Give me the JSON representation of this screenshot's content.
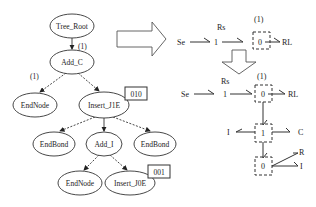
{
  "tree": {
    "nodes": [
      {
        "id": "tree_root",
        "label": "Tree_Root",
        "cx": 72,
        "cy": 26,
        "rx": 22,
        "ry": 12
      },
      {
        "id": "add_c",
        "label": "Add_C",
        "cx": 72,
        "cy": 62,
        "rx": 22,
        "ry": 12
      },
      {
        "id": "endnode_1",
        "label": "EndNode",
        "cx": 35,
        "cy": 105,
        "rx": 22,
        "ry": 12
      },
      {
        "id": "insert_j1e",
        "label": "Insert_J1E",
        "cx": 104,
        "cy": 105,
        "rx": 25,
        "ry": 13
      },
      {
        "id": "endbond_1",
        "label": "EndBond",
        "cx": 54,
        "cy": 144,
        "rx": 21,
        "ry": 12
      },
      {
        "id": "add_i",
        "label": "Add_I",
        "cx": 104,
        "cy": 144,
        "rx": 18,
        "ry": 12
      },
      {
        "id": "endbond_2",
        "label": "EndBond",
        "cx": 155,
        "cy": 144,
        "rx": 21,
        "ry": 12
      },
      {
        "id": "endnode_2",
        "label": "EndNode",
        "cx": 80,
        "cy": 183,
        "rx": 22,
        "ry": 12
      },
      {
        "id": "insert_j0e",
        "label": "Insert_J0E",
        "cx": 130,
        "cy": 183,
        "rx": 25,
        "ry": 12
      }
    ],
    "edge_labels": [
      {
        "text": "(1)",
        "x": 78,
        "y": 49
      },
      {
        "text": "(1)",
        "x": 30,
        "y": 79
      }
    ],
    "code_boxes": [
      {
        "text": "010",
        "x": 125,
        "y": 87,
        "w": 22,
        "h": 13
      },
      {
        "text": "001",
        "x": 148,
        "y": 165,
        "w": 22,
        "h": 13
      }
    ]
  },
  "bond_graph_top": {
    "labels": {
      "se": "Se",
      "one": "1",
      "rs": "Rs",
      "zero": "0",
      "rl": "RL",
      "junction_tag": "(1)"
    }
  },
  "bond_graph_bottom": {
    "labels": {
      "se": "Se",
      "one": "1",
      "rs": "Rs",
      "zero_top": "0",
      "rl": "RL",
      "junction_tag": "(1)",
      "one_mid": "1",
      "i_left": "I",
      "c_right": "C",
      "zero_bottom": "0",
      "r": "R",
      "i_right": "I"
    }
  }
}
